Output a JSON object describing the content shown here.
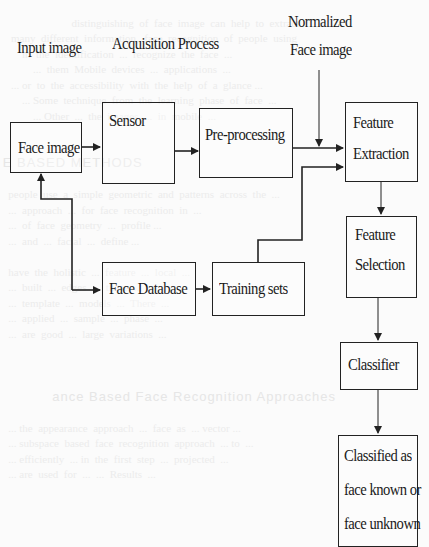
{
  "diagram": {
    "title_labels": {
      "input_image": "Input image",
      "acquisition_process": "Acquisition Process",
      "normalized_line1": "Normalized",
      "normalized_line2": "Face image"
    },
    "nodes": {
      "face_image": "Face image",
      "sensor": "Sensor",
      "preprocessing": "Pre-processing",
      "feature_extraction_line1": "Feature",
      "feature_extraction_line2": "Extraction",
      "feature_selection_line1": "Feature",
      "feature_selection_line2": "Selection",
      "classifier": "Classifier",
      "classified_line1": "Classified as",
      "classified_line2": "face known or",
      "classified_line3": "face unknown",
      "face_database": "Face Database",
      "training_sets": "Training sets"
    },
    "edges": [
      {
        "from": "Face image",
        "to": "Sensor"
      },
      {
        "from": "Sensor",
        "to": "Pre-processing"
      },
      {
        "from": "Pre-processing",
        "to": "Feature Extraction"
      },
      {
        "from": "Normalized Face image",
        "to": "Feature Extraction"
      },
      {
        "from": "Training sets",
        "to": "Feature Extraction"
      },
      {
        "from": "Feature Extraction",
        "to": "Feature Selection"
      },
      {
        "from": "Feature Selection",
        "to": "Classifier"
      },
      {
        "from": "Classifier",
        "to": "Classified as face known or face unknown"
      },
      {
        "from": "Face image",
        "to": "Face Database"
      },
      {
        "from": "Face Database",
        "to": "Training sets"
      }
    ],
    "colors": {
      "line": "#222222",
      "background": "#fbfbfb"
    }
  }
}
